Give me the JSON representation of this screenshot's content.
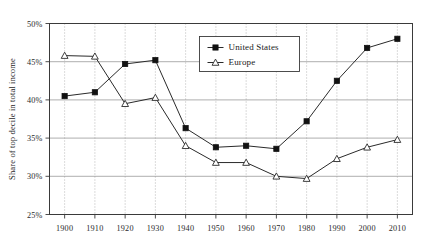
{
  "chart_data": {
    "type": "line",
    "title": "",
    "subtitle": "",
    "xlabel": "",
    "ylabel": "Share of top decile in total income",
    "x": [
      1900,
      1910,
      1920,
      1930,
      1940,
      1950,
      1960,
      1970,
      1980,
      1990,
      2000,
      2010
    ],
    "categories": [
      "1900",
      "1910",
      "1920",
      "1930",
      "1940",
      "1950",
      "1960",
      "1970",
      "1980",
      "1990",
      "2000",
      "2010"
    ],
    "xlim": [
      1895,
      2015
    ],
    "ylim": [
      25,
      50
    ],
    "ytick_values": [
      25,
      30,
      35,
      40,
      45,
      50
    ],
    "ytick_labels": [
      "25%",
      "30%",
      "35%",
      "40%",
      "45%",
      "50%"
    ],
    "xtick_labels": [
      "1900",
      "1910",
      "1920",
      "1930",
      "1940",
      "1950",
      "1960",
      "1970",
      "1980",
      "1990",
      "2000",
      "2010"
    ],
    "grid": {
      "horizontal": true,
      "vertical": true,
      "vertical_style": "dotted",
      "horizontal_style": "solid"
    },
    "legend": {
      "position": "top-center-right",
      "entries": [
        {
          "name": "United States",
          "marker": "filled-square"
        },
        {
          "name": "Europe",
          "marker": "open-triangle"
        }
      ]
    },
    "series": [
      {
        "name": "United States",
        "marker": "filled-square",
        "color": "#111111",
        "values": [
          40.5,
          41.0,
          44.7,
          45.2,
          36.3,
          33.8,
          34.0,
          33.6,
          37.2,
          42.5,
          46.8,
          48.0
        ]
      },
      {
        "name": "Europe",
        "marker": "open-triangle",
        "color": "#2a2a2a",
        "values": [
          45.8,
          45.7,
          39.5,
          40.3,
          34.0,
          31.8,
          31.8,
          30.0,
          29.7,
          32.3,
          33.8,
          34.8
        ]
      }
    ]
  },
  "legend": {
    "united_states": "United States",
    "europe": "Europe"
  },
  "axes": {
    "y_title": "Share of top decile in total income"
  }
}
